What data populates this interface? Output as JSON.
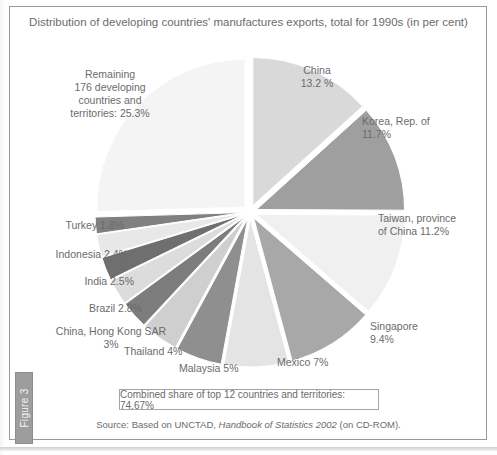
{
  "figure": {
    "tab_label": "Figure 3"
  },
  "chart_title": "Distribution of developing countries' manufactures exports,\ntotal for 1990s (in per cent)",
  "combined_share_note": "Combined share of top 12 countries and territories: 74.67%",
  "source": {
    "prefix": "Source: Based on UNCTAD, ",
    "italic": "Handbook of Statistics 2002",
    "suffix": " (on CD-ROM)."
  },
  "labels": {
    "china": "China\n13.2 %",
    "korea": "Korea, Rep. of\n11.7%",
    "taiwan": "Taiwan, province\nof China 11.2%",
    "singapore": "Singapore\n9.4%",
    "mexico": "Mexico 7%",
    "malaysia": "Malaysia 5%",
    "thailand": "Thailand 4%",
    "hongkong": "China, Hong Kong SAR\n3%",
    "brazil": "Brazil 2.8%",
    "india": "India 2.5%",
    "indonesia": "Indonesia 2.4%",
    "turkey": "Turkey 1.8%",
    "remaining": "Remaining\n176 developing\ncountries and\nterritories: 25.3%"
  },
  "chart_data": {
    "type": "pie",
    "title": "Distribution of developing countries' manufactures exports, total for 1990s (in per cent)",
    "unit": "per cent",
    "legend": "none (direct slice labels)",
    "exploded": true,
    "total_labelled": 100.0,
    "categories": [
      "China",
      "Korea, Rep. of",
      "Taiwan, province of China",
      "Singapore",
      "Mexico",
      "Malaysia",
      "Thailand",
      "China, Hong Kong SAR",
      "Brazil",
      "India",
      "Indonesia",
      "Turkey",
      "Remaining 176 developing countries and territories"
    ],
    "values": [
      13.2,
      11.7,
      11.2,
      9.4,
      7.0,
      5.0,
      4.0,
      3.0,
      2.8,
      2.5,
      2.4,
      1.8,
      25.3
    ],
    "value_labels": [
      "13.2 %",
      "11.7%",
      "11.2%",
      "9.4%",
      "7%",
      "5%",
      "4%",
      "3%",
      "2.8%",
      "2.5%",
      "2.4%",
      "1.8%",
      "25.3%"
    ],
    "colors": [
      "#d9d9d9",
      "#9f9f9f",
      "#f0f0f0",
      "#a8a8a8",
      "#e4e4e4",
      "#8f8f8f",
      "#cfcfcf",
      "#7d7d7d",
      "#dcdcdc",
      "#6f6f6f",
      "#e8e8e8",
      "#808080",
      "#f4f4f4"
    ],
    "annotations": [
      "Combined share of top 12 countries and territories: 74.67%"
    ]
  }
}
